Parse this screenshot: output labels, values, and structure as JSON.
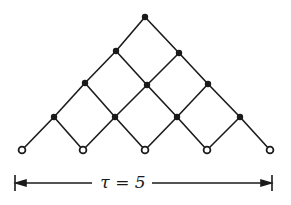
{
  "diagram": {
    "type": "triangular-lattice",
    "label": "τ = 5",
    "colors": {
      "ink": "#1a1a1a",
      "background": "#ffffff"
    },
    "nodes": {
      "filled": [
        [
          145,
          17
        ],
        [
          116,
          51
        ],
        [
          179,
          53
        ],
        [
          85,
          83
        ],
        [
          147,
          85
        ],
        [
          208,
          84
        ],
        [
          54,
          117
        ],
        [
          115,
          117
        ],
        [
          177,
          117
        ],
        [
          240,
          117
        ]
      ],
      "open": [
        [
          22,
          150
        ],
        [
          83,
          150
        ],
        [
          145,
          150
        ],
        [
          207,
          150
        ],
        [
          270,
          150
        ]
      ]
    },
    "edges": [
      [
        [
          145,
          17
        ],
        [
          116,
          51
        ]
      ],
      [
        [
          116,
          51
        ],
        [
          85,
          83
        ]
      ],
      [
        [
          85,
          83
        ],
        [
          54,
          117
        ]
      ],
      [
        [
          54,
          117
        ],
        [
          22,
          150
        ]
      ],
      [
        [
          179,
          53
        ],
        [
          147,
          85
        ]
      ],
      [
        [
          147,
          85
        ],
        [
          115,
          117
        ]
      ],
      [
        [
          115,
          117
        ],
        [
          83,
          150
        ]
      ],
      [
        [
          208,
          84
        ],
        [
          177,
          117
        ]
      ],
      [
        [
          177,
          117
        ],
        [
          145,
          150
        ]
      ],
      [
        [
          240,
          117
        ],
        [
          207,
          150
        ]
      ],
      [
        [
          145,
          17
        ],
        [
          179,
          53
        ]
      ],
      [
        [
          179,
          53
        ],
        [
          208,
          84
        ]
      ],
      [
        [
          208,
          84
        ],
        [
          240,
          117
        ]
      ],
      [
        [
          240,
          117
        ],
        [
          270,
          150
        ]
      ],
      [
        [
          116,
          51
        ],
        [
          147,
          85
        ]
      ],
      [
        [
          147,
          85
        ],
        [
          177,
          117
        ]
      ],
      [
        [
          177,
          117
        ],
        [
          207,
          150
        ]
      ],
      [
        [
          85,
          83
        ],
        [
          115,
          117
        ]
      ],
      [
        [
          115,
          117
        ],
        [
          145,
          150
        ]
      ],
      [
        [
          54,
          117
        ],
        [
          83,
          150
        ]
      ]
    ],
    "dimension_bar": {
      "x1": 15,
      "x2": 272,
      "y": 183
    }
  }
}
